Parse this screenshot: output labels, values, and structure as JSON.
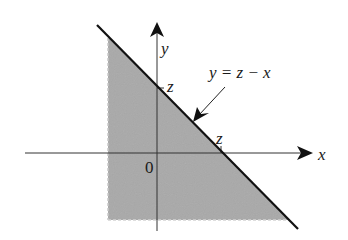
{
  "diagram": {
    "type": "region-plot",
    "axes": {
      "x_label": "x",
      "y_label": "y",
      "origin_label": "0"
    },
    "line": {
      "equation_label": "y = z − x",
      "y_intercept_label": "z",
      "x_intercept_label": "z"
    },
    "colors": {
      "shade": "#a8a8a8",
      "line": "#111111",
      "axis": "#333333",
      "background": "#ffffff"
    }
  }
}
